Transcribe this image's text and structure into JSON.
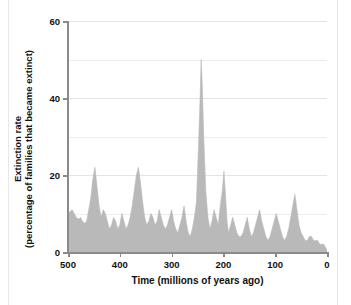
{
  "figure": {
    "ghost_header": "",
    "axis_color": "#8a8a8a",
    "grid_color": "#ededed",
    "area_fill": "#b9b9b9",
    "background": "#ffffff"
  },
  "chart_data": {
    "type": "area",
    "title": "",
    "xlabel": "Time  (millions of years ago)",
    "ylabel_line1": "Extinction rate",
    "ylabel_line2": "(percentage of families that became extinct)",
    "xlim": [
      500,
      0
    ],
    "ylim": [
      0,
      60
    ],
    "x_reversed": true,
    "grid": true,
    "legend": "none",
    "xticks": [
      500,
      400,
      300,
      200,
      100,
      0
    ],
    "xtick_labels": [
      "500",
      "400",
      "300",
      "200",
      "100",
      "0"
    ],
    "yticks": [
      0,
      20,
      40,
      60
    ],
    "ytick_labels": [
      "0",
      "20",
      "40",
      "60"
    ],
    "y_minor_gridlines": [
      10,
      30,
      50
    ],
    "series_name": "Extinction rate",
    "x": [
      500,
      496,
      492,
      488,
      484,
      480,
      476,
      472,
      468,
      464,
      460,
      456,
      452,
      448,
      444,
      440,
      436,
      432,
      428,
      424,
      420,
      416,
      412,
      408,
      404,
      400,
      396,
      392,
      388,
      384,
      380,
      376,
      372,
      368,
      364,
      360,
      356,
      352,
      348,
      344,
      340,
      336,
      332,
      328,
      324,
      320,
      316,
      312,
      308,
      304,
      300,
      296,
      292,
      288,
      284,
      280,
      276,
      272,
      268,
      264,
      260,
      256,
      252,
      248,
      245,
      243,
      241,
      238,
      234,
      230,
      226,
      222,
      218,
      214,
      210,
      206,
      202,
      199,
      196,
      193,
      190,
      186,
      182,
      178,
      174,
      170,
      166,
      162,
      158,
      154,
      150,
      146,
      142,
      138,
      134,
      130,
      126,
      122,
      118,
      114,
      110,
      106,
      102,
      98,
      94,
      90,
      86,
      82,
      78,
      74,
      70,
      66,
      62,
      58,
      54,
      50,
      46,
      42,
      38,
      34,
      30,
      26,
      22,
      18,
      14,
      10,
      6,
      2,
      0
    ],
    "values": [
      10,
      10.5,
      11,
      10,
      9,
      8.5,
      9,
      8,
      7.5,
      8,
      11,
      14,
      19,
      22,
      17,
      12,
      9,
      11,
      10,
      8,
      6,
      7,
      9,
      8,
      6,
      7,
      10,
      8,
      6,
      7,
      9,
      12,
      16,
      20,
      22,
      18,
      13,
      9,
      7,
      8,
      10,
      9,
      7,
      8,
      11,
      9,
      7,
      6,
      7,
      9,
      11,
      8,
      6,
      5,
      7,
      9,
      12,
      8,
      5,
      4,
      6,
      9,
      13,
      28,
      40,
      50,
      44,
      30,
      16,
      9,
      6,
      8,
      11,
      9,
      7,
      12,
      16,
      21,
      15,
      8,
      5,
      7,
      9,
      7,
      5,
      4,
      4,
      5,
      7,
      9,
      6,
      4,
      5,
      7,
      9,
      11,
      8,
      6,
      4,
      3,
      4,
      6,
      8,
      10,
      8,
      6,
      4,
      3,
      4,
      6,
      9,
      12,
      15,
      11,
      7,
      5,
      4,
      3,
      3,
      4,
      4,
      3,
      3,
      3,
      2,
      2,
      2,
      1,
      0.5
    ],
    "annotations": [
      {
        "label": "Permian mass extinction peak",
        "x": 245,
        "y": 50
      },
      {
        "label": "Late Ordovician peak",
        "x": 450,
        "y": 22
      },
      {
        "label": "Late Devonian peak",
        "x": 363,
        "y": 22
      },
      {
        "label": "Late Triassic peak",
        "x": 200,
        "y": 21
      },
      {
        "label": "Cretaceous peak",
        "x": 65,
        "y": 15
      }
    ]
  }
}
